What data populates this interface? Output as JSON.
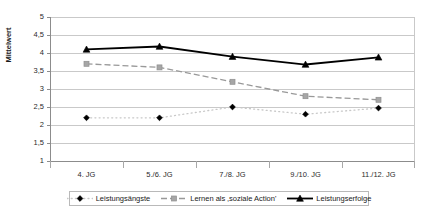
{
  "chart_data": {
    "type": "line",
    "title": "",
    "xlabel": "",
    "ylabel": "Mittelwert",
    "categories": [
      "4. JG",
      "5./6. JG",
      "7./8. JG",
      "9./10. JG",
      "11./12. JG"
    ],
    "ylim": [
      1,
      5
    ],
    "ytick_labels": [
      "5",
      "4,5",
      "4",
      "3,5",
      "3",
      "2,5",
      "2",
      "1,5",
      "1"
    ],
    "ytick_values": [
      5,
      4.5,
      4,
      3.5,
      3,
      2.5,
      2,
      1.5,
      1
    ],
    "grid": true,
    "legend_position": "bottom",
    "series": [
      {
        "name": "Leistungsängste",
        "values": [
          2.2,
          2.2,
          2.5,
          2.3,
          2.47
        ],
        "line_style": "dotted",
        "line_color": "#c8c8c8",
        "marker": "diamond",
        "marker_color": "#000000"
      },
      {
        "name": "Lernen als ‚soziale Action'",
        "values": [
          3.7,
          3.6,
          3.2,
          2.8,
          2.7
        ],
        "line_style": "dashed",
        "line_color": "#999999",
        "marker": "square",
        "marker_color": "#a6a6a6"
      },
      {
        "name": "Leistungserfolge",
        "values": [
          4.1,
          4.18,
          3.9,
          3.68,
          3.88
        ],
        "line_style": "solid",
        "line_color": "#000000",
        "marker": "triangle",
        "marker_color": "#000000"
      }
    ]
  },
  "axes": {
    "y_title": "Mittelwert"
  },
  "colors": {
    "grid": "#c9c9c9",
    "axis": "#808080",
    "plot_background": "#ffffff",
    "legend_border": "#b9b9b9"
  }
}
